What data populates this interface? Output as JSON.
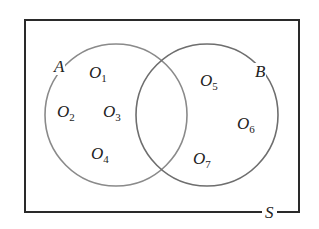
{
  "diagram": {
    "type": "venn",
    "universe_label": "S",
    "sets": [
      {
        "name": "A",
        "label": "A"
      },
      {
        "name": "B",
        "label": "B"
      }
    ],
    "outcomes": [
      {
        "base": "O",
        "sub": "1",
        "region": "A only"
      },
      {
        "base": "O",
        "sub": "2",
        "region": "A only"
      },
      {
        "base": "O",
        "sub": "3",
        "region": "A only"
      },
      {
        "base": "O",
        "sub": "4",
        "region": "A only"
      },
      {
        "base": "O",
        "sub": "5",
        "region": "B only"
      },
      {
        "base": "O",
        "sub": "6",
        "region": "B only"
      },
      {
        "base": "O",
        "sub": "7",
        "region": "B only"
      }
    ],
    "colors": {
      "rect": "#2a2a2a",
      "circle_a": "#8a8a8a",
      "circle_b": "#6e6e6e"
    }
  }
}
